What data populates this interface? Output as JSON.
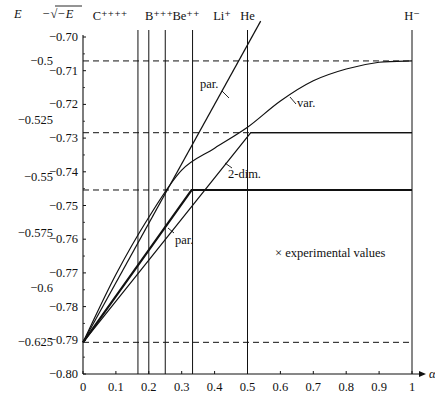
{
  "chart_data": {
    "type": "line",
    "title": "",
    "xlabel": "α",
    "ylabel_left": "E",
    "ylabel_inner": "−√−E",
    "xlim": [
      0,
      1
    ],
    "ylim": [
      -0.8,
      -0.7
    ],
    "x_ticks": [
      "0",
      "0.1",
      "0.2",
      "0.3",
      "0.4",
      "0.5",
      "0.6",
      "0.7",
      "0.8",
      "0.9",
      "1"
    ],
    "y_ticks_sqrt": [
      "−0.70",
      "−0.71",
      "−0.72",
      "−0.73",
      "−0.74",
      "−0.75",
      "−0.76",
      "−0.77",
      "−0.78",
      "−0.79",
      "−0.80"
    ],
    "y_ticks_E": [
      {
        "label": "−0.5",
        "value": -0.5
      },
      {
        "label": "−0.525",
        "value": -0.525
      },
      {
        "label": "−0.55",
        "value": -0.55
      },
      {
        "label": "−0.575",
        "value": -0.575
      },
      {
        "label": "−0.6",
        "value": -0.6
      },
      {
        "label": "−0.625",
        "value": -0.625
      }
    ],
    "ions": [
      {
        "label": "C⁺⁺⁺⁺",
        "alpha": 0.167
      },
      {
        "label": "B⁺⁺⁺",
        "alpha": 0.2
      },
      {
        "label": "Be⁺⁺",
        "alpha": 0.25
      },
      {
        "label": "Li⁺",
        "alpha": 0.333
      },
      {
        "label": "He",
        "alpha": 0.5
      },
      {
        "label": "H⁻",
        "alpha": 1.0
      }
    ],
    "dashed_levels": [
      -0.7071,
      -0.7284,
      -0.7454,
      -0.7906
    ],
    "series": [
      {
        "name": "par. (upper)",
        "x": [
          0,
          0.54
        ],
        "y": [
          -0.7906,
          -0.6953
        ]
      },
      {
        "name": "var.",
        "x": [
          0,
          0.1,
          0.2,
          0.3,
          0.4,
          0.5,
          0.6,
          0.7,
          0.8,
          0.9,
          1.0
        ],
        "y": [
          -0.7906,
          -0.7705,
          -0.7535,
          -0.7395,
          -0.733,
          -0.7268,
          -0.719,
          -0.713,
          -0.7095,
          -0.7075,
          -0.7071
        ]
      },
      {
        "name": "2-dim.",
        "x": [
          0,
          0.51,
          1.0
        ],
        "y": [
          -0.7906,
          -0.7284,
          -0.7284
        ]
      },
      {
        "name": "par. (lower)",
        "x": [
          0,
          0.33,
          1.0
        ],
        "y": [
          -0.7906,
          -0.7454,
          -0.7454
        ]
      }
    ],
    "annotations": [
      "par.",
      "var.",
      "2-dim.",
      "par.",
      "× experimental values"
    ],
    "grid": false,
    "legend_position": "none"
  },
  "labels": {
    "E_axis": "E",
    "sqrt_axis": "−√−E",
    "alpha_axis": "α",
    "par_upper": "par.",
    "var": "var.",
    "two_dim": "2-dim.",
    "par_lower": "par.",
    "experimental": "× experimental values"
  }
}
